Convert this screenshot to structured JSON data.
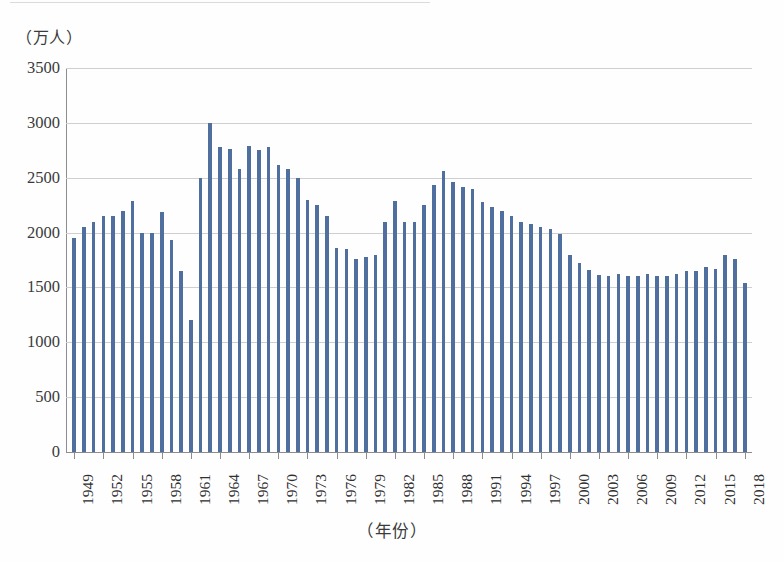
{
  "chart_data": {
    "type": "bar",
    "title": "",
    "subtitle": "",
    "xlabel": "（年份）",
    "ylabel": "（万人）",
    "unit_caption": "（万人）",
    "ylim": [
      0,
      3500
    ],
    "ytick_step": 500,
    "ytick_labels": [
      "3500",
      "3000",
      "2500",
      "2000",
      "1500",
      "1000",
      "500",
      "0"
    ],
    "ytick_values": [
      3500,
      3000,
      2500,
      2000,
      1500,
      1000,
      500,
      0
    ],
    "grid": true,
    "grid_axis": "y",
    "legend": "none",
    "xtick_label_rotation": -90,
    "xtick_label_interval": 3,
    "xtick_labels": [
      "1949",
      "1952",
      "1955",
      "1958",
      "1961",
      "1964",
      "1967",
      "1970",
      "1973",
      "1976",
      "1979",
      "1982",
      "1985",
      "1988",
      "1991",
      "1994",
      "1997",
      "2000",
      "2003",
      "2006",
      "2009",
      "2012",
      "2015",
      "2018"
    ],
    "bar_color": "#4f6f9f",
    "categories": [
      "1949",
      "1950",
      "1951",
      "1952",
      "1953",
      "1954",
      "1955",
      "1956",
      "1957",
      "1958",
      "1959",
      "1960",
      "1961",
      "1962",
      "1963",
      "1964",
      "1965",
      "1966",
      "1967",
      "1968",
      "1969",
      "1970",
      "1971",
      "1972",
      "1973",
      "1974",
      "1975",
      "1976",
      "1977",
      "1978",
      "1979",
      "1980",
      "1981",
      "1982",
      "1983",
      "1984",
      "1985",
      "1986",
      "1987",
      "1988",
      "1989",
      "1990",
      "1991",
      "1992",
      "1993",
      "1994",
      "1995",
      "1996",
      "1997",
      "1998",
      "1999",
      "2000",
      "2001",
      "2002",
      "2003",
      "2004",
      "2005",
      "2006",
      "2007",
      "2008",
      "2009",
      "2010",
      "2011",
      "2012",
      "2013",
      "2014",
      "2015",
      "2016",
      "2017",
      "2018"
    ],
    "values": [
      1950,
      2050,
      2100,
      2150,
      2150,
      2200,
      2290,
      2000,
      2000,
      2190,
      1930,
      1650,
      1200,
      2500,
      3000,
      2780,
      2760,
      2580,
      2790,
      2750,
      2780,
      2620,
      2580,
      2500,
      2300,
      2250,
      2150,
      1860,
      1850,
      1760,
      1780,
      1800,
      2100,
      2290,
      2100,
      2100,
      2250,
      2430,
      2560,
      2460,
      2420,
      2400,
      2280,
      2230,
      2200,
      2150,
      2100,
      2080,
      2050,
      2030,
      1990,
      1800,
      1720,
      1660,
      1610,
      1600,
      1620,
      1600,
      1600,
      1620,
      1600,
      1600,
      1620,
      1650,
      1650,
      1690,
      1670,
      1800,
      1760,
      1540
    ]
  }
}
